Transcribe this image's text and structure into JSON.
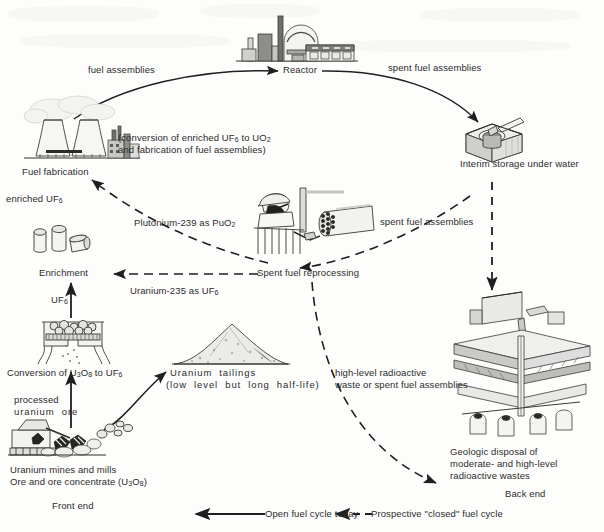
{
  "diagram": {
    "nodes": {
      "reactor": "Reactor",
      "fuel_fabrication": "Fuel fabrication",
      "fuel_fabrication_note_line1": "(conversion of enriched UF6 to UO2",
      "fuel_fabrication_note_line2": "and fabrication of fuel assemblies)",
      "interim_storage": "Interim storage under water",
      "spent_fuel_reprocessing": "Spent fuel reprocessing",
      "enrichment": "Enrichment",
      "conversion": "Conversion of U3O8 to UF6",
      "uranium_tailings": "Uranium  tailings",
      "uranium_tailings_note": "(low  level  but  long  half-life)",
      "mines_and_mills": "Uranium mines and mills",
      "ore_concentrate": "Ore and ore concentrate (U3O8)",
      "geologic_disposal_line1": "Geologic disposal of",
      "geologic_disposal_line2": "moderate- and high-level",
      "geologic_disposal_line3": "radioactive wastes"
    },
    "flows": {
      "fuel_assemblies_to_reactor": "fuel assemblies",
      "spent_fuel_to_storage": "spent fuel assemblies",
      "spent_fuel_to_reprocessing": "spent fuel assemblies",
      "plutonium": "Plutonium-239 as PuO2",
      "uranium235": "Uranium-235 as UF6",
      "enriched_uf6": "enriched UF6",
      "uf6": "UF6",
      "processed_ore_line1": "processed",
      "processed_ore_line2": "uranium  ore",
      "hlw_line1": "high-level radioactive",
      "hlw_line2": "waste or spent fuel assemblies"
    },
    "sections": {
      "front_end": "Front end",
      "back_end": "Back end"
    },
    "legend": {
      "open_cycle": "Open fuel cycle today",
      "closed_cycle": "Prospective \"closed\" fuel cycle"
    },
    "colors": {
      "ink": "#262626",
      "line": "#1f1f1f",
      "fill_light": "#f0f0ee",
      "fill_mid": "#c9c9c6",
      "fill_dark": "#6e6e6b",
      "background": "#fdfdfc"
    }
  }
}
